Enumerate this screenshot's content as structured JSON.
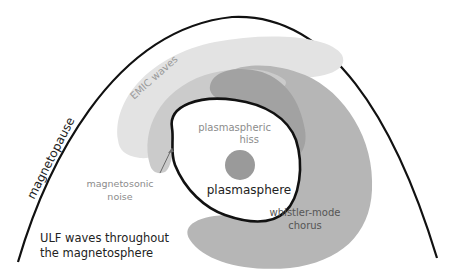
{
  "diagram": {
    "labels": {
      "magnetopause": "magnetopause",
      "emic": "EMIC waves",
      "hiss_line1": "plasmaspheric",
      "hiss_line2": "hiss",
      "magnetosonic_line1": "magnetosonic",
      "magnetosonic_line2": "noise",
      "plasmasphere": "plasmasphere",
      "chorus_line1": "whistler-mode",
      "chorus_line2": "chorus",
      "ulf_line1": "ULF waves throughout",
      "ulf_line2": "the magnetosphere"
    },
    "colors": {
      "background": "#ffffff",
      "outline": "#111111",
      "emic_region": "#e3e3e3",
      "magnetosonic_band": "#cbcbcb",
      "chorus_region": "#b6b6b6",
      "hiss_band": "#a2a2a2",
      "earth": "#9a9a9a",
      "plasmasphere_fill": "#ffffff",
      "label_gray": "#8c8c8c",
      "label_dark": "#333333"
    }
  }
}
